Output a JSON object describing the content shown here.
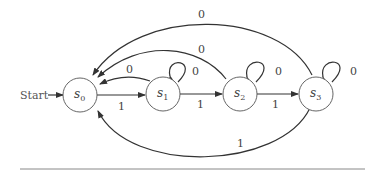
{
  "diagram": {
    "type": "finite-state-machine",
    "start_label": "Start",
    "states": [
      {
        "id": "s0",
        "name": "s",
        "sub": "0",
        "cx": 80,
        "cy": 95
      },
      {
        "id": "s1",
        "name": "s",
        "sub": "1",
        "cx": 163,
        "cy": 92
      },
      {
        "id": "s2",
        "name": "s",
        "sub": "2",
        "cx": 240,
        "cy": 92
      },
      {
        "id": "s3",
        "name": "s",
        "sub": "3",
        "cx": 316,
        "cy": 92
      }
    ],
    "transitions": [
      {
        "from": "s0",
        "to": "s1",
        "label": "1"
      },
      {
        "from": "s1",
        "to": "s2",
        "label": "1"
      },
      {
        "from": "s2",
        "to": "s3",
        "label": "1"
      },
      {
        "from": "s3",
        "to": "s0",
        "label": "1"
      },
      {
        "from": "s1",
        "to": "s0",
        "label": "0"
      },
      {
        "from": "s2",
        "to": "s0",
        "label": "0"
      },
      {
        "from": "s3",
        "to": "s0",
        "label": "0"
      },
      {
        "from": "s1",
        "to": "s1",
        "label": "0"
      },
      {
        "from": "s2",
        "to": "s2",
        "label": "0"
      },
      {
        "from": "s3",
        "to": "s3",
        "label": "0"
      }
    ],
    "labels": {
      "e01": "1",
      "e12": "1",
      "e23": "1",
      "e30": "1",
      "e10": "0",
      "e20": "0",
      "e30top": "0",
      "loop1": "0",
      "loop2": "0",
      "loop3": "0"
    }
  }
}
